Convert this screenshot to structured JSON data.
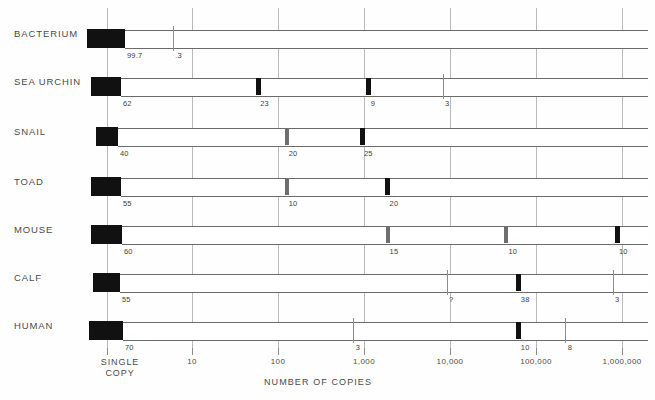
{
  "chart_data": {
    "type": "bar",
    "title": "",
    "subtitle": "",
    "xlabel": "NUMBER OF COPIES",
    "ylabel": "",
    "scale": "log",
    "grid": true,
    "legend": null,
    "x_tick_labels": [
      "SINGLE COPY",
      "10",
      "100",
      "1,000",
      "10,000",
      "100,000",
      "1,000,000"
    ],
    "x_tick_values": [
      1,
      10,
      100,
      1000,
      10000,
      100000,
      1000000
    ],
    "categories": [
      "BACTERIUM",
      "SEA URCHIN",
      "SNAIL",
      "TOAD",
      "MOUSE",
      "CALF",
      "HUMAN"
    ],
    "series": [
      {
        "name": "BACTERIUM",
        "points": [
          {
            "label": "99.7",
            "copies": 1,
            "style": "block",
            "percent": 99.7
          },
          {
            "label": ".3",
            "copies": 6,
            "style": "hairline",
            "percent": 0.3
          }
        ]
      },
      {
        "name": "SEA URCHIN",
        "points": [
          {
            "label": "62",
            "copies": 1,
            "style": "block",
            "percent": 62
          },
          {
            "label": "23",
            "copies": 60,
            "style": "marker",
            "percent": 23
          },
          {
            "label": "9",
            "copies": 1200,
            "style": "marker",
            "percent": 9
          },
          {
            "label": "3",
            "copies": 9000,
            "style": "hairline",
            "percent": 3
          }
        ]
      },
      {
        "name": "SNAIL",
        "points": [
          {
            "label": "40",
            "copies": 1,
            "style": "block",
            "percent": 40
          },
          {
            "label": "20",
            "copies": 130,
            "style": "marker-gray",
            "percent": 20
          },
          {
            "label": "25",
            "copies": 1000,
            "style": "marker",
            "percent": 25
          }
        ]
      },
      {
        "name": "TOAD",
        "points": [
          {
            "label": "55",
            "copies": 1,
            "style": "block",
            "percent": 55
          },
          {
            "label": "10",
            "copies": 130,
            "style": "marker-gray",
            "percent": 10
          },
          {
            "label": "20",
            "copies": 2000,
            "style": "marker",
            "percent": 20
          }
        ]
      },
      {
        "name": "MOUSE",
        "points": [
          {
            "label": "60",
            "copies": 1,
            "style": "block",
            "percent": 60
          },
          {
            "label": "15",
            "copies": 2000,
            "style": "marker-gray",
            "percent": 15
          },
          {
            "label": "10",
            "copies": 50000,
            "style": "marker-gray",
            "percent": 10
          },
          {
            "label": "10",
            "copies": 1000000,
            "style": "marker",
            "percent": 10
          }
        ]
      },
      {
        "name": "CALF",
        "points": [
          {
            "label": "55",
            "copies": 1,
            "style": "block",
            "percent": 55
          },
          {
            "label": "?",
            "copies": 10000,
            "style": "hairline",
            "percent": null
          },
          {
            "label": "38",
            "copies": 70000,
            "style": "marker",
            "percent": 38
          },
          {
            "label": "3",
            "copies": 900000,
            "style": "hairline",
            "percent": 3
          }
        ]
      },
      {
        "name": "HUMAN",
        "points": [
          {
            "label": "70",
            "copies": 1,
            "style": "block",
            "percent": 70
          },
          {
            "label": "3",
            "copies": 800,
            "style": "hairline",
            "percent": 3
          },
          {
            "label": "10",
            "copies": 70000,
            "style": "marker",
            "percent": 10
          },
          {
            "label": "8",
            "copies": 250000,
            "style": "hairline",
            "percent": 8
          }
        ]
      }
    ]
  },
  "colors": {
    "block": "#111111",
    "marker": "#111111",
    "marker_gray": "#6e6e6e",
    "hairline": "#8d8d8d",
    "grid": "#b9b9b9",
    "bar_outline": "#6b6b6b",
    "text": "#4a4a4a",
    "background": "#ffffff"
  },
  "layout": {
    "rows": [
      {
        "top": 16
      },
      {
        "top": 64
      },
      {
        "top": 114
      },
      {
        "top": 164
      },
      {
        "top": 212
      },
      {
        "top": 260
      },
      {
        "top": 308
      }
    ],
    "gridline_x": [
      107,
      192,
      278,
      364,
      450,
      536,
      622
    ],
    "plot_left": 88,
    "plot_right": 648,
    "bar_block_widths": [
      38,
      30,
      22,
      30,
      31,
      27,
      34
    ]
  }
}
